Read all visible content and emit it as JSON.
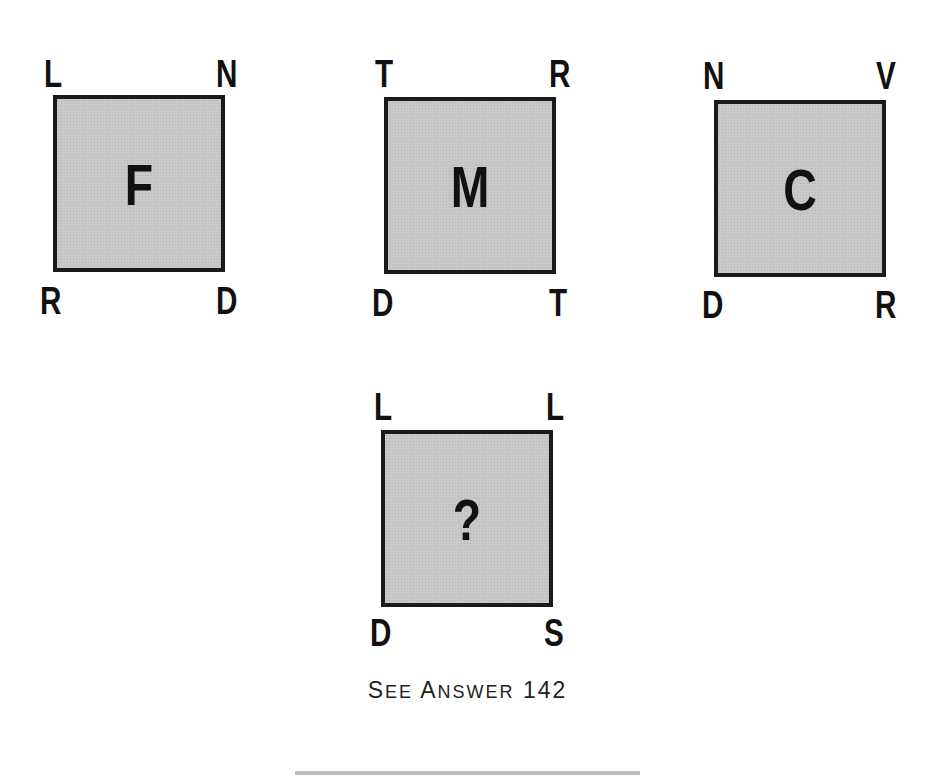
{
  "puzzle": {
    "squares": [
      {
        "center": "F",
        "top_left": "L",
        "top_right": "N",
        "bottom_left": "R",
        "bottom_right": "D"
      },
      {
        "center": "M",
        "top_left": "T",
        "top_right": "R",
        "bottom_left": "D",
        "bottom_right": "T"
      },
      {
        "center": "C",
        "top_left": "N",
        "top_right": "V",
        "bottom_left": "D",
        "bottom_right": "R"
      },
      {
        "center": "?",
        "top_left": "L",
        "top_right": "L",
        "bottom_left": "D",
        "bottom_right": "S"
      }
    ]
  },
  "caption": {
    "see": "S",
    "see_rest": "EE",
    "answer": "A",
    "answer_rest": "NSWER",
    "number": "142"
  },
  "colors": {
    "fill": "#c8c8c8",
    "border": "#1a1a1a",
    "text": "#111111"
  }
}
